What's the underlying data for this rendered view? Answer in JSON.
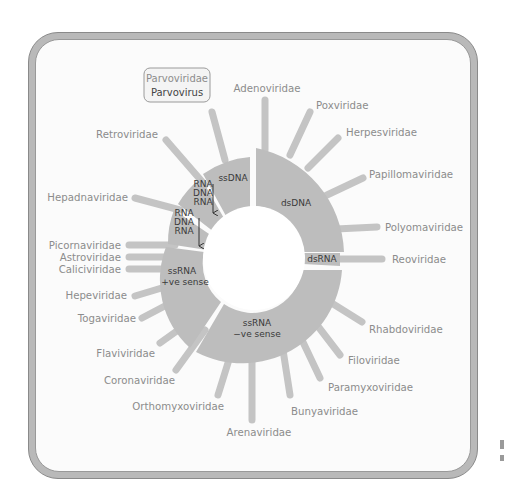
{
  "diagram": {
    "title_box": {
      "family": "Parvoviridae",
      "genus": "Parvovirus"
    },
    "colors": {
      "ring": "#bdbdbd",
      "spoke": "#c4c4c4",
      "label_text": "#8c8c8c",
      "segment_text": "#3a3a3a",
      "frame": "#b9b9b9"
    },
    "segments": [
      {
        "id": "ssDNA",
        "label": "ssDNA"
      },
      {
        "id": "dsDNA",
        "label": "dsDNA"
      },
      {
        "id": "dsRNA",
        "label": "dsRNA"
      },
      {
        "id": "ssRNA-neg",
        "label_line1": "ssRNA",
        "label_line2": "−ve sense"
      },
      {
        "id": "ssRNA-pos",
        "label_line1": "ssRNA",
        "label_line2": "+ve sense"
      },
      {
        "id": "hepadna-rt",
        "line1": "RNA",
        "line2": "DNA",
        "line3": "RNA"
      },
      {
        "id": "retro-rt",
        "line1": "RNA",
        "line2": "DNA",
        "line3": "RNA"
      }
    ],
    "families": [
      {
        "name": "Adenoviridae"
      },
      {
        "name": "Poxviridae"
      },
      {
        "name": "Herpesviridae"
      },
      {
        "name": "Papillomaviridae"
      },
      {
        "name": "Polyomaviridae"
      },
      {
        "name": "Reoviridae"
      },
      {
        "name": "Rhabdoviridae"
      },
      {
        "name": "Filoviridae"
      },
      {
        "name": "Paramyxoviridae"
      },
      {
        "name": "Bunyaviridae"
      },
      {
        "name": "Arenaviridae"
      },
      {
        "name": "Orthomyxoviridae"
      },
      {
        "name": "Coronaviridae"
      },
      {
        "name": "Flaviviridae"
      },
      {
        "name": "Togaviridae"
      },
      {
        "name": "Hepeviridae"
      },
      {
        "name": "Caliciviridae"
      },
      {
        "name": "Astroviridae"
      },
      {
        "name": "Picornaviridae"
      },
      {
        "name": "Hepadnaviridae"
      },
      {
        "name": "Retroviridae"
      }
    ]
  }
}
